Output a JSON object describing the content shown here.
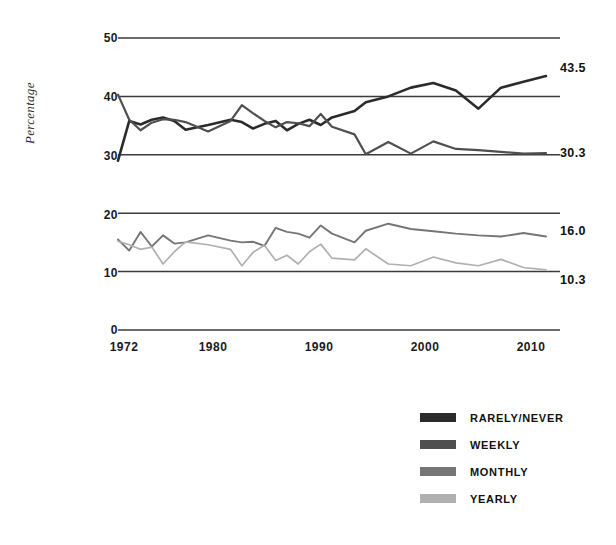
{
  "chart_data": {
    "type": "line",
    "title": "",
    "xlabel": "",
    "ylabel": "Percentage",
    "xlim": [
      1972,
      2010
    ],
    "ylim": [
      0,
      50
    ],
    "yticks": [
      0,
      10,
      20,
      30,
      40,
      50
    ],
    "xticks": [
      1972,
      1980,
      1990,
      2000,
      2010
    ],
    "grid": true,
    "legend_position": "bottom-right",
    "x": [
      1972,
      1973,
      1974,
      1975,
      1976,
      1977,
      1978,
      1980,
      1982,
      1983,
      1984,
      1985,
      1986,
      1987,
      1988,
      1989,
      1990,
      1991,
      1993,
      1994,
      1996,
      1998,
      2000,
      2002,
      2004,
      2006,
      2008,
      2010
    ],
    "series": [
      {
        "name": "RARELY/NEVER",
        "color": "#2b2b2b",
        "end_label": "43.5",
        "values": [
          29.0,
          35.8,
          35.2,
          36.0,
          36.4,
          35.8,
          34.3,
          35.1,
          36.0,
          35.6,
          34.5,
          35.3,
          35.8,
          34.2,
          35.3,
          36.0,
          35.1,
          36.4,
          37.5,
          39.0,
          40.0,
          41.5,
          42.3,
          41.0,
          37.9,
          41.5,
          42.5,
          43.5
        ]
      },
      {
        "name": "WEEKLY",
        "color": "#4f4f4f",
        "end_label": "30.3",
        "values": [
          40.3,
          36.0,
          34.2,
          35.5,
          36.1,
          36.0,
          35.6,
          34.0,
          35.8,
          38.5,
          37.1,
          35.8,
          34.7,
          35.6,
          35.4,
          34.9,
          37.0,
          34.8,
          33.5,
          30.1,
          32.2,
          30.2,
          32.3,
          31.0,
          30.8,
          30.5,
          30.2,
          30.3
        ]
      },
      {
        "name": "MONTHLY",
        "color": "#767676",
        "end_label": "16.0",
        "values": [
          15.5,
          13.6,
          16.8,
          14.3,
          16.2,
          14.8,
          15.0,
          16.2,
          15.3,
          15.0,
          15.1,
          14.4,
          17.5,
          16.8,
          16.5,
          15.8,
          17.9,
          16.5,
          15.0,
          17.0,
          18.2,
          17.3,
          16.9,
          16.5,
          16.2,
          16.0,
          16.6,
          16.0
        ]
      },
      {
        "name": "YEARLY",
        "color": "#b0b0b0",
        "end_label": "10.3",
        "values": [
          15.2,
          14.6,
          13.8,
          14.2,
          11.3,
          13.4,
          15.1,
          14.6,
          13.8,
          11.0,
          13.3,
          14.5,
          11.9,
          12.8,
          11.3,
          13.4,
          14.7,
          12.3,
          12.0,
          13.9,
          11.3,
          11.0,
          12.5,
          11.5,
          11.0,
          12.1,
          10.7,
          10.3
        ]
      }
    ]
  },
  "legend": {
    "items": [
      {
        "label": "RARELY/NEVER",
        "color": "#2b2b2b"
      },
      {
        "label": "WEEKLY",
        "color": "#4f4f4f"
      },
      {
        "label": "MONTHLY",
        "color": "#767676"
      },
      {
        "label": "YEARLY",
        "color": "#b0b0b0"
      }
    ]
  },
  "axis": {
    "y_title": "Percentage",
    "y_tick_labels": [
      "50",
      "40",
      "30",
      "20",
      "10",
      "0"
    ],
    "x_tick_labels": [
      "1972",
      "1980",
      "1990",
      "2000",
      "2010"
    ]
  },
  "end_labels": {
    "rarely_never": "43.5",
    "weekly": "30.3",
    "monthly": "16.0",
    "yearly": "10.3"
  }
}
